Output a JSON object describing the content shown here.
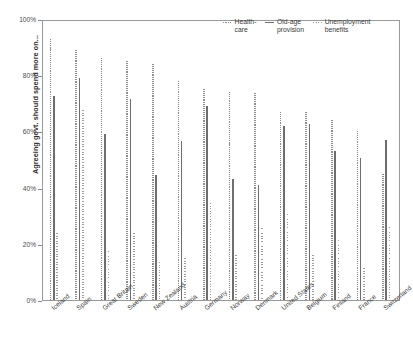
{
  "chart_data": {
    "type": "bar",
    "title": "",
    "subtitle": "",
    "xlabel": "",
    "ylabel": "Agreeing govt. should spend more on...",
    "ylim": [
      0,
      100
    ],
    "y_tick_labels": [
      "0%",
      "20%",
      "40%",
      "60%",
      "80%",
      "100%"
    ],
    "y_ticks": [
      0,
      20,
      40,
      60,
      80,
      100
    ],
    "grid": false,
    "legend_position": "top-right",
    "unit": "%",
    "categories": [
      "Iceland",
      "Spain",
      "Great Britain",
      "Sweden",
      "New Zealand",
      "Austria",
      "Germany",
      "Norway",
      "Denmark",
      "United States",
      "Belgium",
      "Finland",
      "France",
      "Switzerland"
    ],
    "series": [
      {
        "name": "Health-\ncare",
        "label": "Health-care",
        "style": "dashed",
        "color": "#8d8d8d",
        "values": [
          93,
          89,
          86,
          85,
          84,
          78,
          75,
          74,
          73.5,
          67,
          67,
          64,
          60,
          45
        ]
      },
      {
        "name": "Old-age\nprovision",
        "label": "Old-age provision",
        "style": "solid",
        "color": "#6e6e6e",
        "values": [
          72.5,
          79,
          59,
          71.5,
          44.5,
          56.5,
          69,
          43,
          41,
          62,
          62.5,
          53,
          50.5,
          57
        ]
      },
      {
        "name": "Unemployment\nbenefits",
        "label": "Unemployment benefits",
        "style": "dotted",
        "color": "#9d9d9d",
        "values": [
          24,
          67.5,
          17.5,
          24,
          13.5,
          15,
          34.5,
          16,
          25.5,
          30.5,
          16,
          21.5,
          11.5,
          26
        ]
      }
    ]
  },
  "legend": {
    "items": [
      {
        "marker": "dashed-line-marker",
        "text": "Health-\ncare"
      },
      {
        "marker": "solid-line-marker",
        "text": "Old-age\nprovision"
      },
      {
        "marker": "dotted-line-marker",
        "text": "Unemployment\nbenefits"
      }
    ]
  },
  "axis": {
    "y_title": "Agreeing govt. should spend more on..."
  }
}
